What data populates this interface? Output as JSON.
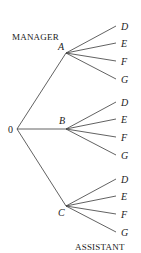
{
  "diagram": {
    "type": "tree",
    "top_label": "MANAGER",
    "bottom_label": "ASSISTANT",
    "root": {
      "label": "0",
      "x": 17,
      "y": 129
    },
    "level1": [
      {
        "label": "A",
        "x": 66,
        "y": 53,
        "lx": 58,
        "ly": 50
      },
      {
        "label": "B",
        "x": 66,
        "y": 129,
        "lx": 59,
        "ly": 124
      },
      {
        "label": "C",
        "x": 66,
        "y": 206,
        "lx": 58,
        "ly": 216
      }
    ],
    "level2_labels": [
      "D",
      "E",
      "F",
      "G"
    ],
    "level2_offsets": [
      -27,
      -10,
      8,
      26
    ],
    "leaf_x": 116
  }
}
